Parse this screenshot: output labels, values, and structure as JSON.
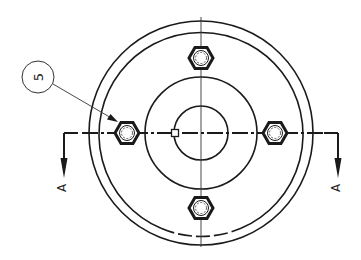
{
  "drawing": {
    "title": "Flange top view with section A-A",
    "colors": {
      "line": "#1a1a1a",
      "thin": "#333333",
      "background": "#ffffff"
    },
    "balloon": {
      "label": "5",
      "cx": 38,
      "cy": 77,
      "r": 16
    },
    "section": {
      "label_left": "A",
      "label_right": "A"
    },
    "center": {
      "x": 201,
      "y": 133
    },
    "circles": {
      "outer_r": 112,
      "rim_r": 102,
      "bolt_circle_r": 74,
      "hub_r": 56,
      "bore_r": 27
    },
    "bolts": [
      {
        "name": "bolt-top",
        "x": 201,
        "y": 58
      },
      {
        "name": "bolt-bottom",
        "x": 201,
        "y": 208
      },
      {
        "name": "bolt-left",
        "x": 127,
        "y": 133
      },
      {
        "name": "bolt-right",
        "x": 275,
        "y": 133
      }
    ]
  }
}
